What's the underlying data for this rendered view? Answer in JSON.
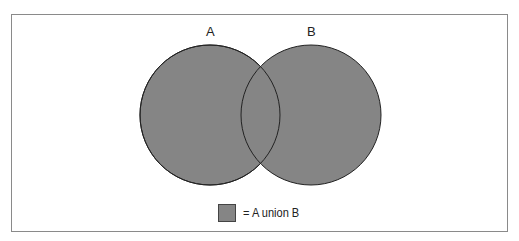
{
  "diagram": {
    "type": "venn",
    "sets": [
      {
        "label": "A",
        "fill": "#858585"
      },
      {
        "label": "B",
        "fill": "#858585"
      }
    ],
    "legend": {
      "swatch_color": "#858585",
      "text": "= A union B"
    }
  }
}
